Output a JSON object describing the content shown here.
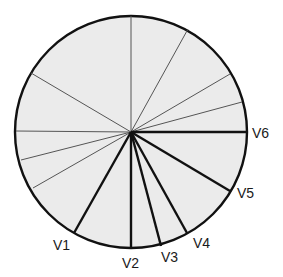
{
  "diagram": {
    "type": "radial-lead-vectors",
    "center": [
      131,
      132
    ],
    "radius": 116,
    "fill_color": "#ebebeb",
    "stroke_color": "#111111",
    "thin_lines": [
      {
        "end": [
          131,
          16
        ]
      },
      {
        "end": [
          188,
          29
        ]
      },
      {
        "end": [
          230,
          74
        ]
      },
      {
        "end": [
          242,
          102
        ]
      },
      {
        "end": [
          31,
          73
        ]
      },
      {
        "end": [
          16,
          131
        ]
      },
      {
        "end": [
          21,
          160
        ]
      },
      {
        "end": [
          33,
          188
        ]
      }
    ],
    "leads": [
      {
        "name": "V1",
        "end": [
          74,
          233
        ],
        "label_pos": [
          53,
          238
        ]
      },
      {
        "name": "V2",
        "end": [
          131,
          248
        ],
        "label_pos": [
          122,
          256
        ]
      },
      {
        "name": "V3",
        "end": [
          161,
          246
        ],
        "label_pos": [
          161,
          250
        ]
      },
      {
        "name": "V4",
        "end": [
          187,
          233
        ],
        "label_pos": [
          193,
          236
        ]
      },
      {
        "name": "V5",
        "end": [
          230,
          191
        ],
        "label_pos": [
          237,
          186
        ]
      },
      {
        "name": "V6",
        "end": [
          247,
          132
        ],
        "label_pos": [
          252,
          126
        ]
      }
    ]
  }
}
